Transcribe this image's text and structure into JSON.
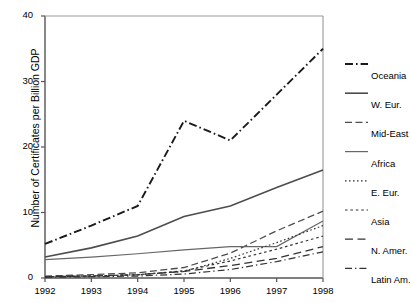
{
  "chart_data": {
    "type": "line",
    "title": "",
    "xlabel": "",
    "ylabel": "Number of Certificates per Billion GDP",
    "x": [
      1992,
      1993,
      1994,
      1995,
      1996,
      1997,
      1998
    ],
    "xtick_labels": [
      "1992",
      "1993",
      "1994",
      "1995",
      "1996",
      "1997",
      "1998"
    ],
    "ytick_labels": [
      "0",
      "10",
      "20",
      "30",
      "40"
    ],
    "yticks": [
      0,
      10,
      20,
      30,
      40
    ],
    "xlim": [
      1992,
      1998
    ],
    "ylim": [
      0,
      40
    ],
    "grid": false,
    "legend_position": "right",
    "series": [
      {
        "name": "Oceania",
        "style": "dash-dot",
        "color": "#1a1a1a",
        "width": 1.9,
        "values": [
          5.2,
          8.0,
          11.0,
          24.0,
          21.0,
          28.0,
          35.0
        ]
      },
      {
        "name": "W. Eur.",
        "style": "solid",
        "color": "#4d4d4d",
        "width": 1.6,
        "values": [
          3.2,
          4.6,
          6.4,
          9.4,
          11.0,
          13.8,
          16.5
        ]
      },
      {
        "name": "Mid-East",
        "style": "dashed",
        "color": "#4d4d4d",
        "width": 1.3,
        "values": [
          0.3,
          0.5,
          0.8,
          1.6,
          3.8,
          7.2,
          10.2
        ]
      },
      {
        "name": "Africa",
        "style": "solid",
        "color": "#666666",
        "width": 1.2,
        "values": [
          2.8,
          3.2,
          3.7,
          4.3,
          4.8,
          4.8,
          8.7
        ]
      },
      {
        "name": "E. Eur.",
        "style": "fine-dotted",
        "color": "#333333",
        "width": 1.2,
        "values": [
          0.2,
          0.3,
          0.5,
          1.0,
          3.0,
          5.4,
          8.0
        ]
      },
      {
        "name": "Asia",
        "style": "dotted",
        "color": "#333333",
        "width": 1.2,
        "values": [
          0.2,
          0.3,
          0.5,
          1.1,
          2.6,
          4.4,
          6.4
        ]
      },
      {
        "name": "N. Amer.",
        "style": "dashed-wide",
        "color": "#333333",
        "width": 1.3,
        "values": [
          0.2,
          0.3,
          0.5,
          1.0,
          1.9,
          3.0,
          4.8
        ]
      },
      {
        "name": "Latin Am.",
        "style": "dash-dot-thin",
        "color": "#333333",
        "width": 1.2,
        "values": [
          0.1,
          0.2,
          0.3,
          0.6,
          1.3,
          2.5,
          4.0
        ]
      }
    ]
  },
  "legend": {
    "items": [
      {
        "label": "Oceania"
      },
      {
        "label": "W. Eur."
      },
      {
        "label": "Mid-East"
      },
      {
        "label": "Africa"
      },
      {
        "label": "E. Eur."
      },
      {
        "label": "Asia"
      },
      {
        "label": "N. Amer."
      },
      {
        "label": "Latin Am."
      }
    ]
  }
}
